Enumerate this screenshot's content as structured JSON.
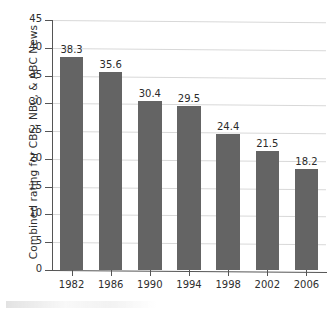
{
  "chart_data": {
    "type": "bar",
    "title": "",
    "xlabel": "",
    "ylabel": "Combined rating for CBS, NBC, & ABC News",
    "categories": [
      "1982",
      "1986",
      "1990",
      "1994",
      "1998",
      "2002",
      "2006"
    ],
    "values": [
      38.3,
      35.6,
      30.4,
      29.5,
      24.4,
      21.5,
      18.2
    ],
    "value_labels": [
      "38.3",
      "35.6",
      "30.4",
      "29.5",
      "24.4",
      "21.5",
      "18.2"
    ],
    "ylim": [
      0,
      45
    ],
    "yticks": [
      0,
      5,
      10,
      15,
      20,
      25,
      30,
      35,
      40,
      45
    ],
    "ytick_labels": [
      "0",
      "5",
      "10",
      "15",
      "20",
      "25",
      "30",
      "35",
      "40",
      "45"
    ],
    "grid": "horizontal",
    "legend": "none",
    "bar_color": "#646464",
    "background_color": "#ffffff",
    "gridline_color": "#d8d8d8",
    "axis_color": "#555555"
  }
}
